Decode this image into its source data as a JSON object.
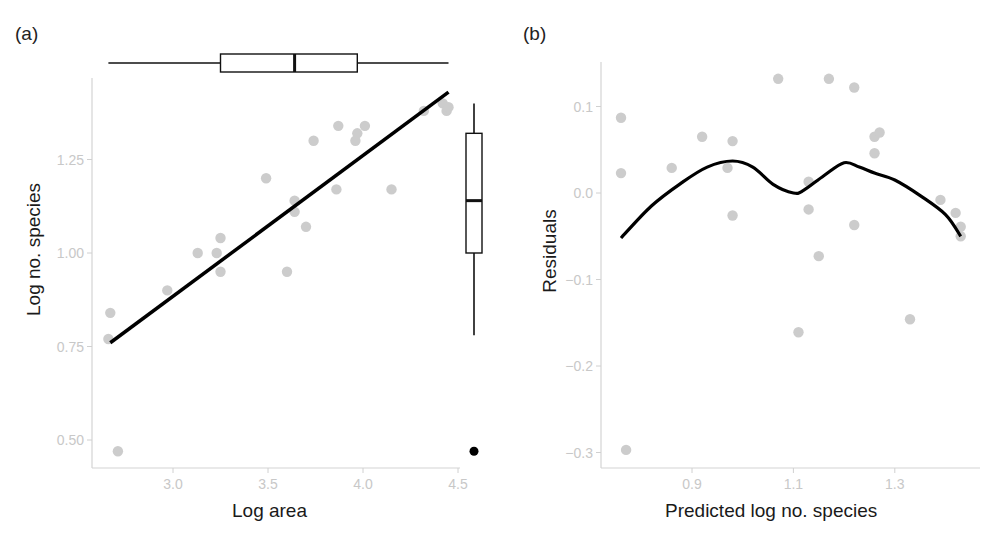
{
  "figure": {
    "panel_a": {
      "label": "(a)",
      "xlabel": "Log area",
      "ylabel": "Log no. species",
      "xticks": [
        "3.0",
        "3.5",
        "4.0",
        "4.5"
      ],
      "yticks": [
        "0.50",
        "0.75",
        "1.00",
        "1.25"
      ]
    },
    "panel_b": {
      "label": "(b)",
      "xlabel": "Predicted log no. species",
      "ylabel": "Residuals",
      "xticks": [
        "0.9",
        "1.1",
        "1.3"
      ],
      "yticks": [
        "-0.3",
        "-0.2",
        "-0.1",
        "0.0",
        "0.1"
      ]
    },
    "colors": {
      "points": "#cccccc",
      "fit_line": "#000000",
      "axis": "#d0d0d0",
      "tick_text": "#c8c8c8",
      "outlier": "#000000"
    }
  },
  "chart_data": [
    {
      "type": "scatter",
      "title": "(a)",
      "xlabel": "Log area",
      "ylabel": "Log no. species",
      "xlim": [
        2.6,
        4.52
      ],
      "ylim": [
        0.45,
        1.44
      ],
      "xticks": [
        3.0,
        3.5,
        4.0,
        4.5
      ],
      "yticks": [
        0.5,
        0.75,
        1.0,
        1.25
      ],
      "grid": false,
      "points": [
        [
          2.67,
          0.84
        ],
        [
          2.66,
          0.77
        ],
        [
          2.71,
          0.47
        ],
        [
          2.97,
          0.9
        ],
        [
          3.13,
          1.0
        ],
        [
          3.23,
          1.0
        ],
        [
          3.25,
          1.04
        ],
        [
          3.25,
          0.95
        ],
        [
          3.49,
          1.2
        ],
        [
          3.6,
          0.95
        ],
        [
          3.64,
          1.14
        ],
        [
          3.64,
          1.11
        ],
        [
          3.7,
          1.07
        ],
        [
          3.74,
          1.3
        ],
        [
          3.86,
          1.17
        ],
        [
          3.87,
          1.34
        ],
        [
          3.96,
          1.3
        ],
        [
          3.97,
          1.32
        ],
        [
          4.01,
          1.34
        ],
        [
          4.15,
          1.17
        ],
        [
          4.32,
          1.38
        ],
        [
          4.42,
          1.4
        ],
        [
          4.44,
          1.38
        ],
        [
          4.45,
          1.39
        ]
      ],
      "fit_line": {
        "type": "linear",
        "from": [
          2.67,
          0.76
        ],
        "to": [
          4.45,
          1.43
        ]
      },
      "marginal_boxplot_x": {
        "min": 2.66,
        "q1": 3.25,
        "median": 3.64,
        "q3": 3.97,
        "max": 4.45
      },
      "marginal_boxplot_y": {
        "min": 0.78,
        "q1": 1.0,
        "median": 1.14,
        "q3": 1.32,
        "max": 1.4,
        "outliers": [
          0.47
        ]
      }
    },
    {
      "type": "scatter",
      "title": "(b)",
      "xlabel": "Predicted log no. species",
      "ylabel": "Residuals",
      "xlim": [
        0.72,
        1.46
      ],
      "ylim": [
        -0.32,
        0.15
      ],
      "xticks": [
        0.9,
        1.1,
        1.3
      ],
      "yticks": [
        -0.3,
        -0.2,
        -0.1,
        0.0,
        0.1
      ],
      "grid": false,
      "points": [
        [
          0.76,
          0.087
        ],
        [
          0.76,
          0.023
        ],
        [
          0.77,
          -0.297
        ],
        [
          0.86,
          0.029
        ],
        [
          0.92,
          0.065
        ],
        [
          0.97,
          0.029
        ],
        [
          0.98,
          0.06
        ],
        [
          0.98,
          -0.026
        ],
        [
          1.07,
          0.132
        ],
        [
          1.11,
          -0.161
        ],
        [
          1.13,
          0.013
        ],
        [
          1.13,
          -0.019
        ],
        [
          1.15,
          -0.073
        ],
        [
          1.17,
          0.132
        ],
        [
          1.22,
          0.122
        ],
        [
          1.22,
          -0.037
        ],
        [
          1.26,
          0.046
        ],
        [
          1.26,
          0.065
        ],
        [
          1.27,
          0.07
        ],
        [
          1.33,
          -0.146
        ],
        [
          1.39,
          -0.008
        ],
        [
          1.42,
          -0.023
        ],
        [
          1.43,
          -0.039
        ],
        [
          1.43,
          -0.05
        ]
      ],
      "smooth_line": {
        "type": "loess",
        "x": [
          0.76,
          0.82,
          0.88,
          0.93,
          0.98,
          1.02,
          1.06,
          1.1,
          1.12,
          1.16,
          1.2,
          1.23,
          1.26,
          1.3,
          1.35,
          1.4,
          1.43
        ],
        "y": [
          -0.052,
          -0.015,
          0.012,
          0.03,
          0.037,
          0.03,
          0.01,
          0.0,
          0.003,
          0.02,
          0.035,
          0.03,
          0.023,
          0.015,
          -0.003,
          -0.025,
          -0.05
        ]
      }
    }
  ]
}
